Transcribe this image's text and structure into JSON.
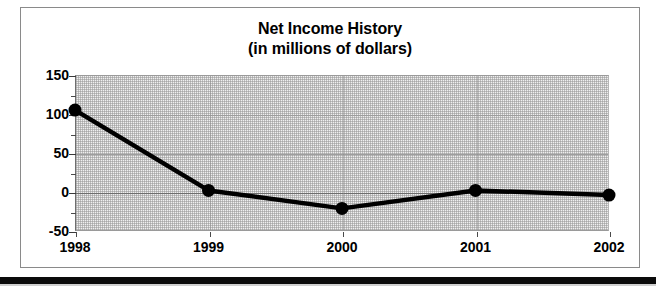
{
  "chart_data": {
    "type": "line",
    "title": "Net Income History",
    "subtitle": "(in millions of dollars)",
    "xlabel": "",
    "ylabel": "",
    "categories": [
      "1998",
      "1999",
      "2000",
      "2001",
      "2002"
    ],
    "values": [
      105,
      2,
      -21,
      2,
      -4
    ],
    "series": [
      {
        "name": "Net Income",
        "values": [
          105,
          2,
          -21,
          2,
          -4
        ]
      }
    ],
    "ylim": [
      -50,
      150
    ],
    "y_ticks": [
      "150",
      "100",
      "50",
      "0",
      "-50"
    ],
    "y_tick_values": [
      150,
      100,
      50,
      0,
      -50
    ],
    "y_minor_tick_values": [
      125,
      75,
      25,
      -25
    ],
    "grid": true,
    "legend": "none",
    "marker": "filled-circle",
    "line_color": "#000000",
    "marker_color": "#000000",
    "plot_background": "#efefef",
    "frame_color": "#8a8a8a",
    "gridline_color": "#9d9d9d"
  },
  "figure": {
    "title_line_1": "Net Income History",
    "title_line_2": "(in millions of dollars)"
  }
}
